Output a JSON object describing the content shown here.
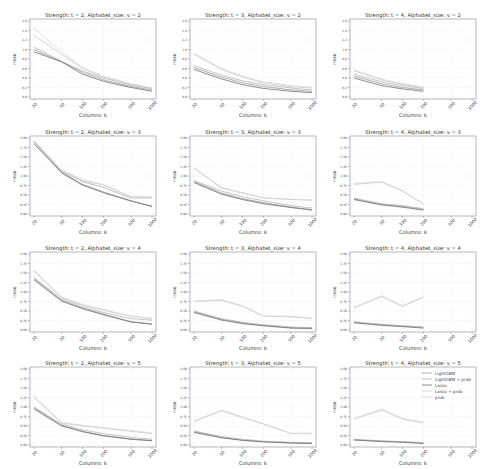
{
  "figure": {
    "rows": 4,
    "cols": 3,
    "xlabel": "Columns: k",
    "ylabel": "rmse",
    "x_ticks": [
      20,
      50,
      100,
      200,
      500,
      1000
    ],
    "legend": {
      "panel_index": 11,
      "entries": [
        {
          "name": "LightGBM",
          "color": "#9a9a9a"
        },
        {
          "name": "LightGBM + prob",
          "color": "#b4b4b4"
        },
        {
          "name": "Lasso",
          "color": "#6e6e6e"
        },
        {
          "name": "Lasso + prob",
          "color": "#c8c8c8"
        },
        {
          "name": "prob",
          "color": "#d8d8d8"
        }
      ]
    }
  },
  "chart_data": [
    {
      "type": "line",
      "title": "Strength: t = 2, Alphabet_size: v = 2",
      "xlabel": "Columns: k",
      "ylabel": "rmse",
      "x": [
        20,
        50,
        100,
        200,
        500,
        1000
      ],
      "xscale": "log",
      "ylim": [
        0.0,
        1.6
      ],
      "yticks": [
        0.0,
        0.2,
        0.4,
        0.6,
        0.8,
        1.0,
        1.2,
        1.4,
        1.6
      ],
      "series": [
        {
          "name": "LightGBM",
          "values": [
            1.0,
            0.74,
            0.52,
            0.36,
            0.22,
            0.15
          ]
        },
        {
          "name": "LightGBM + prob",
          "values": [
            1.05,
            0.75,
            0.55,
            0.4,
            0.25,
            0.18
          ]
        },
        {
          "name": "Lasso",
          "values": [
            0.95,
            0.74,
            0.48,
            0.33,
            0.2,
            0.12
          ]
        },
        {
          "name": "Lasso + prob",
          "values": [
            1.3,
            0.9,
            0.6,
            0.42,
            0.27,
            0.18
          ]
        },
        {
          "name": "prob",
          "values": [
            1.45,
            0.95,
            0.62,
            0.44,
            0.28,
            0.19
          ]
        }
      ]
    },
    {
      "type": "line",
      "title": "Strength: t = 3, Alphabet_size: v = 2",
      "xlabel": "Columns: k",
      "ylabel": "rmse",
      "x": [
        20,
        50,
        100,
        200,
        500,
        1000
      ],
      "xscale": "log",
      "ylim": [
        0.0,
        1.6
      ],
      "yticks": [
        0.0,
        0.2,
        0.4,
        0.6,
        0.8,
        1.0,
        1.2,
        1.4,
        1.6
      ],
      "series": [
        {
          "name": "LightGBM",
          "values": [
            0.62,
            0.42,
            0.3,
            0.22,
            0.15,
            0.12
          ]
        },
        {
          "name": "LightGBM + prob",
          "values": [
            0.66,
            0.46,
            0.34,
            0.26,
            0.19,
            0.15
          ]
        },
        {
          "name": "Lasso",
          "values": [
            0.58,
            0.38,
            0.26,
            0.18,
            0.12,
            0.09
          ]
        },
        {
          "name": "Lasso + prob",
          "values": [
            0.9,
            0.58,
            0.42,
            0.3,
            0.22,
            0.19
          ]
        },
        {
          "name": "prob",
          "values": [
            0.92,
            0.6,
            0.44,
            0.32,
            0.24,
            0.2
          ]
        }
      ]
    },
    {
      "type": "line",
      "title": "Strength: t = 4, Alphabet_size: v = 2",
      "xlabel": "Columns: k",
      "ylabel": "rmse",
      "x": [
        20,
        50,
        100,
        200,
        500,
        1000
      ],
      "xscale": "log",
      "ylim": [
        0.0,
        1.6
      ],
      "yticks": [
        0.0,
        0.2,
        0.4,
        0.6,
        0.8,
        1.0,
        1.2,
        1.4,
        1.6
      ],
      "series": [
        {
          "name": "LightGBM",
          "values": [
            0.44,
            0.28,
            0.2,
            0.15,
            null,
            null
          ]
        },
        {
          "name": "LightGBM + prob",
          "values": [
            0.48,
            0.32,
            0.24,
            0.18,
            null,
            null
          ]
        },
        {
          "name": "Lasso",
          "values": [
            0.4,
            0.24,
            0.17,
            0.12,
            null,
            null
          ]
        },
        {
          "name": "Lasso + prob",
          "values": [
            0.55,
            0.36,
            0.27,
            0.2,
            null,
            null
          ]
        },
        {
          "name": "prob",
          "values": [
            0.57,
            0.38,
            0.28,
            0.21,
            null,
            null
          ]
        }
      ]
    },
    {
      "type": "line",
      "title": "Strength: t = 2, Alphabet_size: v = 3",
      "xlabel": "Columns: k",
      "ylabel": "rmse",
      "x": [
        20,
        50,
        100,
        200,
        500,
        1000
      ],
      "xscale": "log",
      "ylim": [
        0.0,
        2.0
      ],
      "yticks": [
        0.0,
        0.25,
        0.5,
        0.75,
        1.0,
        1.25,
        1.5,
        1.75,
        2.0
      ],
      "series": [
        {
          "name": "LightGBM",
          "values": [
            1.9,
            1.1,
            0.78,
            0.58,
            0.35,
            0.2
          ]
        },
        {
          "name": "LightGBM + prob",
          "values": [
            1.9,
            1.12,
            0.85,
            0.7,
            0.42,
            0.42
          ]
        },
        {
          "name": "Lasso",
          "values": [
            1.85,
            1.08,
            0.76,
            0.56,
            0.34,
            0.2
          ]
        },
        {
          "name": "Lasso + prob",
          "values": [
            1.92,
            1.15,
            0.88,
            0.76,
            0.45,
            0.44
          ]
        },
        {
          "name": "prob",
          "values": [
            1.93,
            1.16,
            0.9,
            0.78,
            0.46,
            0.45
          ]
        }
      ]
    },
    {
      "type": "line",
      "title": "Strength: t = 3, Alphabet_size: v = 3",
      "xlabel": "Columns: k",
      "ylabel": "rmse",
      "x": [
        20,
        50,
        100,
        200,
        500,
        1000
      ],
      "xscale": "log",
      "ylim": [
        0.0,
        2.0
      ],
      "yticks": [
        0.0,
        0.25,
        0.5,
        0.75,
        1.0,
        1.25,
        1.5,
        1.75,
        2.0
      ],
      "series": [
        {
          "name": "LightGBM",
          "values": [
            0.85,
            0.55,
            0.4,
            0.3,
            0.18,
            0.12
          ]
        },
        {
          "name": "LightGBM + prob",
          "values": [
            0.88,
            0.6,
            0.45,
            0.35,
            0.22,
            0.16
          ]
        },
        {
          "name": "Lasso",
          "values": [
            0.83,
            0.52,
            0.38,
            0.27,
            0.17,
            0.1
          ]
        },
        {
          "name": "Lasso + prob",
          "values": [
            1.2,
            0.68,
            0.55,
            0.42,
            0.38,
            0.36
          ]
        },
        {
          "name": "prob",
          "values": [
            1.22,
            0.7,
            0.56,
            0.43,
            0.39,
            0.37
          ]
        }
      ]
    },
    {
      "type": "line",
      "title": "Strength: t = 4, Alphabet_size: v = 3",
      "xlabel": "Columns: k",
      "ylabel": "rmse",
      "x": [
        20,
        50,
        100,
        200,
        500,
        1000
      ],
      "xscale": "log",
      "ylim": [
        0.0,
        2.0
      ],
      "yticks": [
        0.0,
        0.25,
        0.5,
        0.75,
        1.0,
        1.25,
        1.5,
        1.75,
        2.0
      ],
      "series": [
        {
          "name": "LightGBM",
          "values": [
            0.4,
            0.25,
            0.2,
            0.12,
            null,
            null
          ]
        },
        {
          "name": "LightGBM + prob",
          "values": [
            0.42,
            0.27,
            0.22,
            0.14,
            null,
            null
          ]
        },
        {
          "name": "Lasso",
          "values": [
            0.38,
            0.24,
            0.18,
            0.1,
            null,
            null
          ]
        },
        {
          "name": "Lasso + prob",
          "values": [
            0.78,
            0.84,
            0.6,
            0.26,
            null,
            null
          ]
        },
        {
          "name": "prob",
          "values": [
            0.8,
            0.86,
            0.62,
            0.27,
            null,
            null
          ]
        }
      ]
    },
    {
      "type": "line",
      "title": "Strength: t = 2, Alphabet_size: v = 4",
      "xlabel": "Columns: k",
      "ylabel": "rmse",
      "x": [
        20,
        50,
        100,
        200,
        500,
        1000
      ],
      "xscale": "log",
      "ylim": [
        0.0,
        2.0
      ],
      "yticks": [
        0.0,
        0.25,
        0.5,
        0.75,
        1.0,
        1.25,
        1.5,
        1.75,
        2.0
      ],
      "series": [
        {
          "name": "LightGBM",
          "values": [
            1.35,
            0.78,
            0.58,
            0.42,
            0.22,
            0.16
          ]
        },
        {
          "name": "LightGBM + prob",
          "values": [
            1.38,
            0.82,
            0.62,
            0.46,
            0.3,
            0.26
          ]
        },
        {
          "name": "Lasso",
          "values": [
            1.32,
            0.76,
            0.56,
            0.4,
            0.21,
            0.15
          ]
        },
        {
          "name": "Lasso + prob",
          "values": [
            1.55,
            0.85,
            0.66,
            0.52,
            0.36,
            0.3
          ]
        },
        {
          "name": "prob",
          "values": [
            1.58,
            0.87,
            0.68,
            0.54,
            0.37,
            0.31
          ]
        }
      ]
    },
    {
      "type": "line",
      "title": "Strength: t = 3, Alphabet_size: v = 4",
      "xlabel": "Columns: k",
      "ylabel": "rmse",
      "x": [
        20,
        50,
        100,
        200,
        500,
        1000
      ],
      "xscale": "log",
      "ylim": [
        0.0,
        2.0
      ],
      "yticks": [
        0.0,
        0.25,
        0.5,
        0.75,
        1.0,
        1.25,
        1.5,
        1.75,
        2.0
      ],
      "series": [
        {
          "name": "LightGBM",
          "values": [
            0.48,
            0.28,
            0.18,
            0.12,
            0.06,
            0.05
          ]
        },
        {
          "name": "LightGBM + prob",
          "values": [
            0.5,
            0.3,
            0.2,
            0.14,
            0.08,
            0.06
          ]
        },
        {
          "name": "Lasso",
          "values": [
            0.46,
            0.26,
            0.17,
            0.11,
            0.05,
            0.04
          ]
        },
        {
          "name": "Lasso + prob",
          "values": [
            0.75,
            0.78,
            0.62,
            0.36,
            0.35,
            0.3
          ]
        },
        {
          "name": "prob",
          "values": [
            0.76,
            0.8,
            0.64,
            0.37,
            0.36,
            0.31
          ]
        }
      ]
    },
    {
      "type": "line",
      "title": "Strength: t = 4, Alphabet_size: v = 4",
      "xlabel": "Columns: k",
      "ylabel": "rmse",
      "x": [
        20,
        50,
        100,
        200,
        500,
        1000
      ],
      "xscale": "log",
      "ylim": [
        0.0,
        2.0
      ],
      "yticks": [
        0.0,
        0.25,
        0.5,
        0.75,
        1.0,
        1.25,
        1.5,
        1.75,
        2.0
      ],
      "series": [
        {
          "name": "LightGBM",
          "values": [
            0.2,
            0.14,
            0.1,
            0.07,
            null,
            null
          ]
        },
        {
          "name": "LightGBM + prob",
          "values": [
            0.22,
            0.15,
            0.11,
            0.08,
            null,
            null
          ]
        },
        {
          "name": "Lasso",
          "values": [
            0.19,
            0.12,
            0.09,
            0.05,
            null,
            null
          ]
        },
        {
          "name": "Lasso + prob",
          "values": [
            0.58,
            0.88,
            0.62,
            0.86,
            null,
            null
          ]
        },
        {
          "name": "prob",
          "values": [
            0.6,
            0.9,
            0.64,
            0.88,
            null,
            null
          ]
        }
      ]
    },
    {
      "type": "line",
      "title": "Strength: t = 2, Alphabet_size: v = 5",
      "xlabel": "Columns: k",
      "ylabel": "rmse",
      "x": [
        20,
        50,
        100,
        200,
        500,
        1000
      ],
      "xscale": "log",
      "ylim": [
        0.0,
        2.0
      ],
      "yticks": [
        0.0,
        0.25,
        0.5,
        0.75,
        1.0,
        1.25,
        1.5,
        1.75,
        2.0
      ],
      "series": [
        {
          "name": "LightGBM",
          "values": [
            0.98,
            0.52,
            0.36,
            0.25,
            0.16,
            0.12
          ]
        },
        {
          "name": "LightGBM + prob",
          "values": [
            1.0,
            0.55,
            0.4,
            0.3,
            0.2,
            0.15
          ]
        },
        {
          "name": "Lasso",
          "values": [
            0.95,
            0.5,
            0.35,
            0.24,
            0.15,
            0.11
          ]
        },
        {
          "name": "Lasso + prob",
          "values": [
            1.25,
            0.58,
            0.5,
            0.44,
            0.36,
            0.3
          ]
        },
        {
          "name": "prob",
          "values": [
            1.28,
            0.6,
            0.52,
            0.46,
            0.38,
            0.32
          ]
        }
      ]
    },
    {
      "type": "line",
      "title": "Strength: t = 3, Alphabet_size: v = 5",
      "xlabel": "Columns: k",
      "ylabel": "rmse",
      "x": [
        20,
        50,
        100,
        200,
        500,
        1000
      ],
      "xscale": "log",
      "ylim": [
        0.0,
        2.0
      ],
      "yticks": [
        0.0,
        0.25,
        0.5,
        0.75,
        1.0,
        1.25,
        1.5,
        1.75,
        2.0
      ],
      "series": [
        {
          "name": "LightGBM",
          "values": [
            0.35,
            0.2,
            0.13,
            0.09,
            0.06,
            0.05
          ]
        },
        {
          "name": "LightGBM + prob",
          "values": [
            0.37,
            0.22,
            0.15,
            0.1,
            0.07,
            0.06
          ]
        },
        {
          "name": "Lasso",
          "values": [
            0.33,
            0.19,
            0.12,
            0.08,
            0.05,
            0.04
          ]
        },
        {
          "name": "Lasso + prob",
          "values": [
            0.62,
            0.9,
            0.72,
            0.55,
            0.3,
            0.3
          ]
        },
        {
          "name": "prob",
          "values": [
            0.63,
            0.92,
            0.74,
            0.56,
            0.31,
            0.31
          ]
        }
      ]
    },
    {
      "type": "line",
      "title": "Strength: t = 4, Alphabet_size: v = 5",
      "xlabel": "Columns: k",
      "ylabel": "rmse",
      "x": [
        20,
        50,
        100,
        200,
        500,
        1000
      ],
      "xscale": "log",
      "ylim": [
        0.0,
        2.0
      ],
      "yticks": [
        0.0,
        0.25,
        0.5,
        0.75,
        1.0,
        1.25,
        1.5,
        1.75,
        2.0
      ],
      "legend": [
        "LightGBM",
        "LightGBM + prob",
        "Lasso",
        "Lasso + prob",
        "prob"
      ],
      "legend_position": "upper right",
      "series": [
        {
          "name": "LightGBM",
          "values": [
            0.14,
            0.1,
            0.08,
            0.05,
            null,
            null
          ]
        },
        {
          "name": "LightGBM + prob",
          "values": [
            0.15,
            0.11,
            0.09,
            0.06,
            null,
            null
          ]
        },
        {
          "name": "Lasso",
          "values": [
            0.13,
            0.09,
            0.07,
            0.04,
            null,
            null
          ]
        },
        {
          "name": "Lasso + prob",
          "values": [
            0.68,
            0.92,
            0.68,
            0.58,
            null,
            null
          ]
        },
        {
          "name": "prob",
          "values": [
            0.7,
            0.94,
            0.7,
            0.6,
            null,
            null
          ]
        }
      ]
    }
  ]
}
